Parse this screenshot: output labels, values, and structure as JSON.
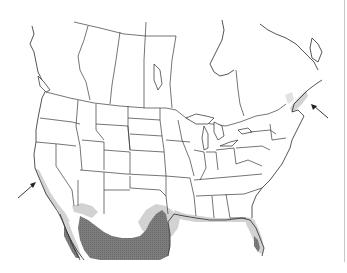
{
  "map": {
    "type": "species-range-map",
    "region": "North America (Canada, United States, Mexico)",
    "background": "#ffffff",
    "boundary_color": "#3a3a3a",
    "range_levels": [
      {
        "name": "peripheral-range",
        "color": "#cfcfcf",
        "description": "light gray shading"
      },
      {
        "name": "core-range",
        "color": "#7a7a7a",
        "description": "dark stippled gray shading"
      }
    ],
    "range_areas": [
      {
        "name": "coastal-california",
        "level": "peripheral-range"
      },
      {
        "name": "southern-arizona",
        "level": "peripheral-range"
      },
      {
        "name": "northern-mexico",
        "level": "core-range"
      },
      {
        "name": "baja-california",
        "level": "core-range"
      },
      {
        "name": "south-texas",
        "level": "core-range"
      },
      {
        "name": "gulf-coast",
        "level": "peripheral-range"
      },
      {
        "name": "florida-peninsula",
        "level": "peripheral-range"
      },
      {
        "name": "south-florida",
        "level": "core-range"
      },
      {
        "name": "nova-scotia",
        "level": "peripheral-range"
      }
    ],
    "arrows": [
      {
        "name": "arrow-california",
        "points_to": "coastal-california"
      },
      {
        "name": "arrow-nova-scotia",
        "points_to": "nova-scotia"
      }
    ]
  }
}
